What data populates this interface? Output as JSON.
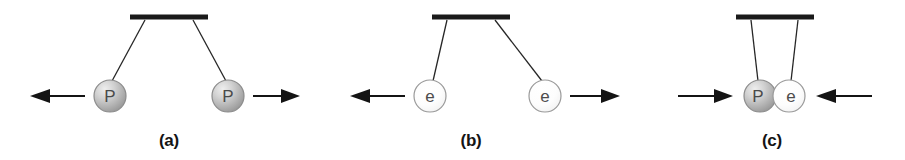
{
  "figure": {
    "background_color": "#ffffff",
    "width": 905,
    "height": 160
  },
  "colors": {
    "ink": "#141414",
    "string": "#262626",
    "proton_fill_light": "#e8e8e8",
    "proton_fill_mid": "#bdbdbd",
    "proton_fill_dark": "#9c9c9c",
    "proton_stroke": "#8c8c8c",
    "electron_fill_light": "#ffffff",
    "electron_fill_mid": "#fafafa",
    "electron_stroke": "#9a9a9a",
    "label_text": "#4a4a4a"
  },
  "panels": [
    {
      "id": "panel-a",
      "caption": "(a)",
      "caption_x": 169,
      "caption_y": 146,
      "interaction": "repulsion",
      "ceiling": {
        "x1": 130,
        "x2": 208,
        "y": 17,
        "thickness": 5
      },
      "balls": [
        {
          "id": "ball-a-left",
          "label": "P",
          "kind": "proton",
          "cx": 110,
          "cy": 96,
          "r": 16,
          "anchor_x": 145,
          "anchor_y": 20
        },
        {
          "id": "ball-a-right",
          "label": "P",
          "kind": "proton",
          "cx": 228,
          "cy": 96,
          "r": 16,
          "anchor_x": 193,
          "anchor_y": 20
        }
      ],
      "arrows": [
        {
          "id": "arrow-a-left",
          "direction": "left",
          "tail_x": 85,
          "head_x": 30,
          "y": 96,
          "meaning": "repulsive force outward"
        },
        {
          "id": "arrow-a-right",
          "direction": "right",
          "tail_x": 253,
          "head_x": 300,
          "y": 96,
          "meaning": "repulsive force outward"
        }
      ]
    },
    {
      "id": "panel-b",
      "caption": "(b)",
      "caption_x": 471,
      "caption_y": 146,
      "interaction": "repulsion",
      "ceiling": {
        "x1": 432,
        "x2": 510,
        "y": 17,
        "thickness": 5
      },
      "balls": [
        {
          "id": "ball-b-left",
          "label": "e",
          "kind": "electron",
          "cx": 430,
          "cy": 96,
          "r": 16,
          "anchor_x": 447,
          "anchor_y": 20
        },
        {
          "id": "ball-b-right",
          "label": "e",
          "kind": "electron",
          "cx": 545,
          "cy": 96,
          "r": 16,
          "anchor_x": 495,
          "anchor_y": 20
        }
      ],
      "arrows": [
        {
          "id": "arrow-b-left",
          "direction": "left",
          "tail_x": 405,
          "head_x": 350,
          "y": 96,
          "meaning": "repulsive force outward"
        },
        {
          "id": "arrow-b-right",
          "direction": "right",
          "tail_x": 570,
          "head_x": 620,
          "y": 96,
          "meaning": "repulsive force outward"
        }
      ]
    },
    {
      "id": "panel-c",
      "caption": "(c)",
      "caption_x": 772,
      "caption_y": 146,
      "interaction": "attraction",
      "ceiling": {
        "x1": 736,
        "x2": 814,
        "y": 17,
        "thickness": 5
      },
      "balls": [
        {
          "id": "ball-c-left",
          "label": "P",
          "kind": "proton",
          "cx": 760,
          "cy": 96,
          "r": 16,
          "anchor_x": 751,
          "anchor_y": 20
        },
        {
          "id": "ball-c-right",
          "label": "e",
          "kind": "electron",
          "cx": 789,
          "cy": 96,
          "r": 16,
          "anchor_x": 798,
          "anchor_y": 20
        }
      ],
      "arrows": [
        {
          "id": "arrow-c-left",
          "direction": "right",
          "tail_x": 678,
          "head_x": 733,
          "y": 96,
          "meaning": "attractive force inward"
        },
        {
          "id": "arrow-c-right",
          "direction": "left",
          "tail_x": 872,
          "head_x": 816,
          "y": 96,
          "meaning": "attractive force inward"
        }
      ]
    }
  ]
}
